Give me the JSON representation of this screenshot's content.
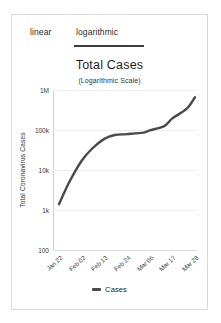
{
  "tabs": [
    {
      "label": "linear",
      "active": false
    },
    {
      "label": "logarithmic",
      "active": true
    }
  ],
  "colors": {
    "series": "#4a4a4a",
    "grid": "#eeeeee",
    "axis": "#cfcfcf",
    "active_tab_underline": "#3c3c3c",
    "card_border": "#d8d8d8",
    "background": "#ffffff"
  },
  "legend": {
    "marker": "line-marker",
    "label": "Cases"
  },
  "chart_data": {
    "type": "line",
    "title": "Total Cases",
    "subtitle": "(Logarithmic Scale)",
    "xlabel": "",
    "ylabel": "Total Coronavirus Cases",
    "yscale": "log",
    "ylim": [
      100,
      1000000
    ],
    "ytick_labels": [
      "1M",
      "100k",
      "10k",
      "1k",
      "100"
    ],
    "ytick_values": [
      1000000,
      100000,
      10000,
      1000,
      100
    ],
    "xtick_labels": [
      "Jan 22",
      "Feb 02",
      "Feb 13",
      "Feb 24",
      "Mar 06",
      "Mar 17",
      "Mar 28"
    ],
    "grid": true,
    "legend_position": "bottom-center",
    "series": [
      {
        "name": "Cases",
        "color": "#4a4a4a",
        "x": [
          "Jan 22",
          "Jan 27",
          "Feb 02",
          "Feb 07",
          "Feb 13",
          "Feb 18",
          "Feb 24",
          "Mar 01",
          "Mar 06",
          "Mar 11",
          "Mar 17",
          "Mar 22",
          "Mar 28"
        ],
        "values": [
          1400,
          5000,
          17000,
          34000,
          60000,
          75000,
          79000,
          86000,
          98000,
          125000,
          195000,
          340000,
          660000
        ]
      }
    ]
  }
}
